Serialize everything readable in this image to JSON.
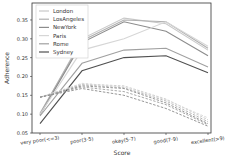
{
  "chart_data": {
    "type": "line",
    "title": "",
    "xlabel": "Score",
    "ylabel": "Adherence",
    "categories": [
      "very poor(<=3)",
      "poor(3-5)",
      "okay(5-7)",
      "good(7-9)",
      "excellent(>9)"
    ],
    "yticks": [
      0.05,
      0.1,
      0.15,
      0.2,
      0.25,
      0.3,
      0.35
    ],
    "ytick_labels": [
      "0.05",
      "0.10",
      "0.15",
      "0.20",
      "0.25",
      "0.30",
      "0.35"
    ],
    "ylim": [
      0.05,
      0.395
    ],
    "grid": false,
    "legend_position": "upper left",
    "series": [
      {
        "name": "London",
        "color": "#c8c8c8",
        "style": "solid",
        "values": [
          0.1,
          0.3,
          0.355,
          0.34,
          0.27
        ]
      },
      {
        "name": "LosAngeles",
        "color": "#b0b0b0",
        "style": "solid",
        "values": [
          0.102,
          0.295,
          0.35,
          0.345,
          0.275
        ]
      },
      {
        "name": "NewYork",
        "color": "#8c8c8c",
        "style": "solid",
        "values": [
          0.098,
          0.29,
          0.345,
          0.32,
          0.255
        ]
      },
      {
        "name": "Paris",
        "color": "#d6d6d6",
        "style": "solid",
        "values": [
          0.1,
          0.27,
          0.3,
          0.345,
          0.28
        ]
      },
      {
        "name": "Rome",
        "color": "#a0a0a0",
        "style": "solid",
        "values": [
          0.095,
          0.235,
          0.27,
          0.275,
          0.225
        ]
      },
      {
        "name": "Sydney",
        "color": "#505050",
        "style": "solid",
        "values": [
          0.075,
          0.215,
          0.25,
          0.255,
          0.21
        ]
      },
      {
        "name": "London-dashed",
        "color": "#c8c8c8",
        "style": "dashed",
        "values": [
          0.145,
          0.18,
          0.175,
          0.14,
          0.085
        ]
      },
      {
        "name": "LosAngeles-dashed",
        "color": "#b0b0b0",
        "style": "dashed",
        "values": [
          0.145,
          0.178,
          0.17,
          0.135,
          0.08
        ]
      },
      {
        "name": "NewYork-dashed",
        "color": "#8c8c8c",
        "style": "dashed",
        "values": [
          0.145,
          0.175,
          0.168,
          0.13,
          0.075
        ]
      },
      {
        "name": "Paris-dashed",
        "color": "#d6d6d6",
        "style": "dashed",
        "values": [
          0.145,
          0.182,
          0.172,
          0.138,
          0.09
        ]
      },
      {
        "name": "Rome-dashed",
        "color": "#a0a0a0",
        "style": "dashed",
        "values": [
          0.145,
          0.172,
          0.16,
          0.125,
          0.072
        ]
      },
      {
        "name": "Sydney-dashed",
        "color": "#8a8a8a",
        "style": "dashed",
        "values": [
          0.145,
          0.168,
          0.15,
          0.115,
          0.068
        ]
      }
    ],
    "legend": [
      "London",
      "LosAngeles",
      "NewYork",
      "Paris",
      "Rome",
      "Sydney"
    ]
  }
}
